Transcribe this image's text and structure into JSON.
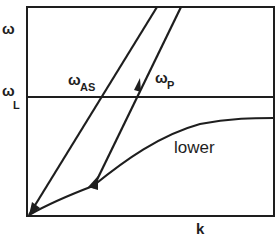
{
  "diagram": {
    "type": "dispersion-diagram",
    "y_axis_label": "ω",
    "x_axis_label": "k",
    "reference_line": {
      "label_main": "ω",
      "label_sub": "L"
    },
    "lines": [
      {
        "id": "as",
        "label_main": "ω",
        "label_sub": "AS"
      },
      {
        "id": "p",
        "label_main": "ω",
        "label_sub": "P"
      }
    ],
    "curve_label": "lower",
    "colors": {
      "line": "#1e1e1e",
      "background": "#ffffff"
    }
  }
}
